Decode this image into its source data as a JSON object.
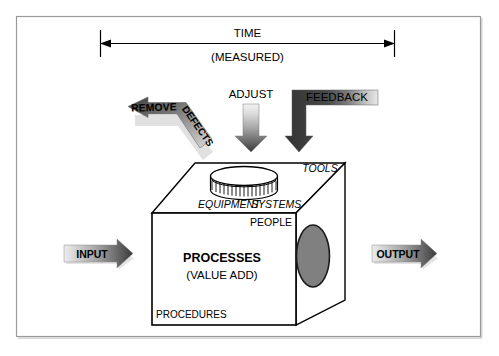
{
  "diagram": {
    "frame": {
      "border_color": "#9a9a9a",
      "background": "#ffffff"
    },
    "colors": {
      "ink": "#000000",
      "arrow_dark": "#3b3b3b",
      "arrow_mid": "#8c8c8c",
      "arrow_light": "#e2e2e2",
      "ellipse_fill": "#808080",
      "cube_face": "#ffffff",
      "frame_border": "#9a9a9a"
    },
    "time_axis": {
      "name": "time-measured-axis",
      "label_primary": "TIME",
      "label_secondary": "(MEASURED)"
    },
    "arrows": {
      "remove_defects": {
        "label_part1": "REMOVE",
        "label_part2": "DEFECTS",
        "direction": "left"
      },
      "adjust": {
        "label": "ADJUST",
        "direction": "down"
      },
      "feedback": {
        "label": "FEEDBACK",
        "direction": "down"
      },
      "input": {
        "label": "INPUT",
        "direction": "right"
      },
      "output": {
        "label": "OUTPUT",
        "direction": "right"
      }
    },
    "cube": {
      "front_title": "PROCESSES",
      "front_subtitle": "(VALUE ADD)",
      "labels": {
        "tools": "TOOLS",
        "equipment": "EQUIPMENT",
        "systems": "SYSTEMS",
        "people": "PEOPLE",
        "procedures": "PROCEDURES"
      }
    }
  }
}
